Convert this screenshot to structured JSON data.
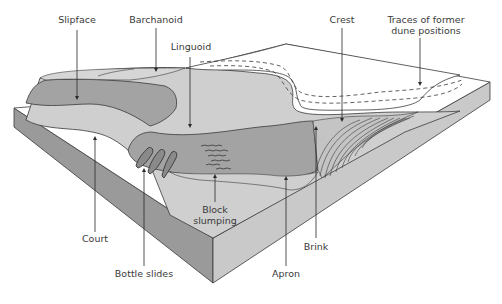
{
  "diagram": {
    "labels": {
      "slipface": "Slipface",
      "barchanoid": "Barchanoid",
      "linguoid": "Linguoid",
      "crest": "Crest",
      "traces_line1": "Traces of former",
      "traces_line2": "dune positions",
      "court": "Court",
      "bottle_slides": "Bottle slides",
      "block_line1": "Block",
      "block_line2": "slumping",
      "apron": "Apron",
      "brink": "Brink"
    },
    "colors": {
      "top_surface": "#ffffff",
      "front_face": "#9a9a9a",
      "right_face": "#c9c9c9",
      "dune_dark": "#a3a3a3",
      "dune_light": "#cfcfcf",
      "outline": "#3a3a3a",
      "text": "#3a3a3a"
    }
  }
}
